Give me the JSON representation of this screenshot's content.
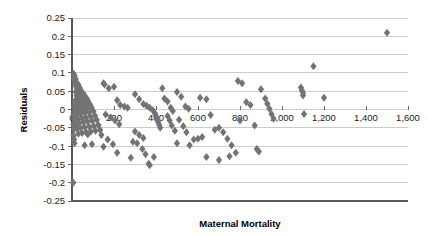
{
  "chart_data": {
    "type": "scatter",
    "title": "",
    "xlabel": "Maternal Mortality",
    "ylabel": "Residuals",
    "xlim": [
      0,
      1600
    ],
    "ylim": [
      -0.25,
      0.25
    ],
    "grid": true,
    "legend": false,
    "marker": {
      "shape": "diamond",
      "color": "#737373",
      "size": 4
    },
    "xticks": [
      0,
      200,
      400,
      600,
      800,
      1000,
      1200,
      1400,
      1600
    ],
    "xtick_labels": [
      "0",
      "200",
      "400",
      "600",
      "800",
      "1,000",
      "1,200",
      "1,400",
      "1,600"
    ],
    "yticks": [
      0.25,
      0.2,
      0.15,
      0.1,
      0.05,
      0,
      -0.05,
      -0.1,
      -0.15,
      -0.2,
      -0.25
    ],
    "ytick_labels": [
      "0.25",
      "0.2",
      "0.15",
      "0.1",
      "0.05",
      "0",
      "-0.05",
      "-0.1",
      "-0.15",
      "-0.2",
      "-0.25"
    ],
    "series": [
      {
        "name": "Residuals",
        "points": [
          [
            8,
            0.098
          ],
          [
            12,
            0.092
          ],
          [
            10,
            0.085
          ],
          [
            18,
            0.083
          ],
          [
            14,
            0.078
          ],
          [
            22,
            0.074
          ],
          [
            16,
            0.07
          ],
          [
            30,
            0.068
          ],
          [
            26,
            0.065
          ],
          [
            20,
            0.062
          ],
          [
            36,
            0.06
          ],
          [
            28,
            0.057
          ],
          [
            24,
            0.055
          ],
          [
            42,
            0.053
          ],
          [
            34,
            0.05
          ],
          [
            18,
            0.048
          ],
          [
            48,
            0.046
          ],
          [
            30,
            0.044
          ],
          [
            56,
            0.042
          ],
          [
            38,
            0.04
          ],
          [
            22,
            0.038
          ],
          [
            62,
            0.036
          ],
          [
            44,
            0.034
          ],
          [
            26,
            0.032
          ],
          [
            70,
            0.03
          ],
          [
            50,
            0.028
          ],
          [
            32,
            0.026
          ],
          [
            14,
            0.024
          ],
          [
            78,
            0.022
          ],
          [
            58,
            0.02
          ],
          [
            40,
            0.018
          ],
          [
            20,
            0.016
          ],
          [
            86,
            0.014
          ],
          [
            64,
            0.012
          ],
          [
            46,
            0.01
          ],
          [
            28,
            0.008
          ],
          [
            10,
            0.006
          ],
          [
            94,
            0.005
          ],
          [
            72,
            0.003
          ],
          [
            52,
            0.001
          ],
          [
            34,
            -0.001
          ],
          [
            16,
            -0.003
          ],
          [
            102,
            -0.005
          ],
          [
            80,
            -0.007
          ],
          [
            60,
            -0.009
          ],
          [
            40,
            -0.011
          ],
          [
            22,
            -0.013
          ],
          [
            8,
            -0.015
          ],
          [
            110,
            -0.017
          ],
          [
            88,
            -0.019
          ],
          [
            66,
            -0.021
          ],
          [
            46,
            -0.023
          ],
          [
            28,
            -0.025
          ],
          [
            12,
            -0.027
          ],
          [
            118,
            -0.029
          ],
          [
            96,
            -0.031
          ],
          [
            74,
            -0.033
          ],
          [
            54,
            -0.035
          ],
          [
            34,
            -0.037
          ],
          [
            18,
            -0.039
          ],
          [
            6,
            -0.041
          ],
          [
            126,
            -0.043
          ],
          [
            104,
            -0.045
          ],
          [
            82,
            -0.047
          ],
          [
            60,
            -0.048
          ],
          [
            40,
            -0.05
          ],
          [
            24,
            -0.052
          ],
          [
            10,
            -0.054
          ],
          [
            134,
            -0.056
          ],
          [
            112,
            -0.058
          ],
          [
            90,
            -0.06
          ],
          [
            68,
            -0.062
          ],
          [
            48,
            -0.064
          ],
          [
            30,
            -0.066
          ],
          [
            150,
            0.072
          ],
          [
            155,
            0.068
          ],
          [
            175,
            0.058
          ],
          [
            200,
            0.062
          ],
          [
            215,
            0.025
          ],
          [
            230,
            0.012
          ],
          [
            250,
            0.008
          ],
          [
            265,
            0.005
          ],
          [
            160,
            -0.014
          ],
          [
            185,
            -0.022
          ],
          [
            205,
            -0.03
          ],
          [
            225,
            -0.04
          ],
          [
            140,
            -0.07
          ],
          [
            170,
            -0.082
          ],
          [
            195,
            -0.095
          ],
          [
            150,
            -0.102
          ],
          [
            215,
            -0.118
          ],
          [
            95,
            -0.095
          ],
          [
            60,
            -0.098
          ],
          [
            75,
            -0.068
          ],
          [
            8,
            -0.072
          ],
          [
            10,
            -0.082
          ],
          [
            12,
            -0.092
          ],
          [
            6,
            -0.2
          ],
          [
            300,
            0.042
          ],
          [
            320,
            0.028
          ],
          [
            340,
            0.015
          ],
          [
            355,
            0.01
          ],
          [
            370,
            0.005
          ],
          [
            385,
            -0.002
          ],
          [
            395,
            -0.01
          ],
          [
            400,
            -0.018
          ],
          [
            405,
            -0.026
          ],
          [
            410,
            -0.034
          ],
          [
            415,
            -0.042
          ],
          [
            420,
            -0.05
          ],
          [
            300,
            -0.06
          ],
          [
            320,
            -0.07
          ],
          [
            340,
            -0.078
          ],
          [
            290,
            -0.088
          ],
          [
            310,
            -0.092
          ],
          [
            335,
            -0.108
          ],
          [
            350,
            -0.122
          ],
          [
            365,
            -0.148
          ],
          [
            370,
            -0.152
          ],
          [
            390,
            -0.13
          ],
          [
            280,
            -0.132
          ],
          [
            430,
            0.058
          ],
          [
            440,
            0.03
          ],
          [
            455,
            0.022
          ],
          [
            470,
            0.005
          ],
          [
            480,
            -0.004
          ],
          [
            455,
            -0.018
          ],
          [
            465,
            -0.03
          ],
          [
            475,
            -0.044
          ],
          [
            490,
            -0.058
          ],
          [
            500,
            0.048
          ],
          [
            520,
            0.035
          ],
          [
            540,
            0.008
          ],
          [
            555,
            0.002
          ],
          [
            510,
            -0.028
          ],
          [
            530,
            -0.046
          ],
          [
            545,
            -0.062
          ],
          [
            500,
            -0.092
          ],
          [
            560,
            -0.098
          ],
          [
            580,
            -0.082
          ],
          [
            600,
            -0.08
          ],
          [
            620,
            -0.075
          ],
          [
            610,
            0.032
          ],
          [
            640,
            0.028
          ],
          [
            660,
            -0.015
          ],
          [
            680,
            -0.055
          ],
          [
            700,
            -0.05
          ],
          [
            720,
            -0.062
          ],
          [
            740,
            -0.08
          ],
          [
            760,
            -0.098
          ],
          [
            640,
            -0.13
          ],
          [
            700,
            -0.138
          ],
          [
            750,
            -0.128
          ],
          [
            780,
            -0.118
          ],
          [
            790,
            0.078
          ],
          [
            810,
            0.072
          ],
          [
            830,
            0.02
          ],
          [
            850,
            0.012
          ],
          [
            800,
            -0.03
          ],
          [
            870,
            -0.044
          ],
          [
            880,
            -0.108
          ],
          [
            890,
            -0.115
          ],
          [
            900,
            0.055
          ],
          [
            920,
            0.03
          ],
          [
            930,
            0.016
          ],
          [
            940,
            0.002
          ],
          [
            950,
            -0.012
          ],
          [
            960,
            -0.025
          ],
          [
            1090,
            0.06
          ],
          [
            1095,
            0.052
          ],
          [
            1100,
            0.045
          ],
          [
            1100,
            0.038
          ],
          [
            1105,
            -0.012
          ],
          [
            1150,
            0.118
          ],
          [
            1200,
            0.032
          ],
          [
            1500,
            0.21
          ]
        ]
      }
    ]
  },
  "axes": {
    "x_title": "Maternal Mortality",
    "y_title": "Residuals"
  }
}
